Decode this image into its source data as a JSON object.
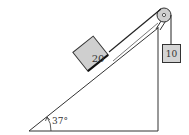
{
  "diagram": {
    "type": "inclined-plane-pulley",
    "incline": {
      "angle_label": "37°"
    },
    "block_on_incline": {
      "label": "20",
      "fill": "#cfcfcf"
    },
    "hanging_block": {
      "label": "10",
      "fill": "#d4d4d4"
    },
    "pulley": {
      "fill": "#d0d0d0"
    },
    "colors": {
      "line": "#333333",
      "background": "#ffffff"
    }
  }
}
